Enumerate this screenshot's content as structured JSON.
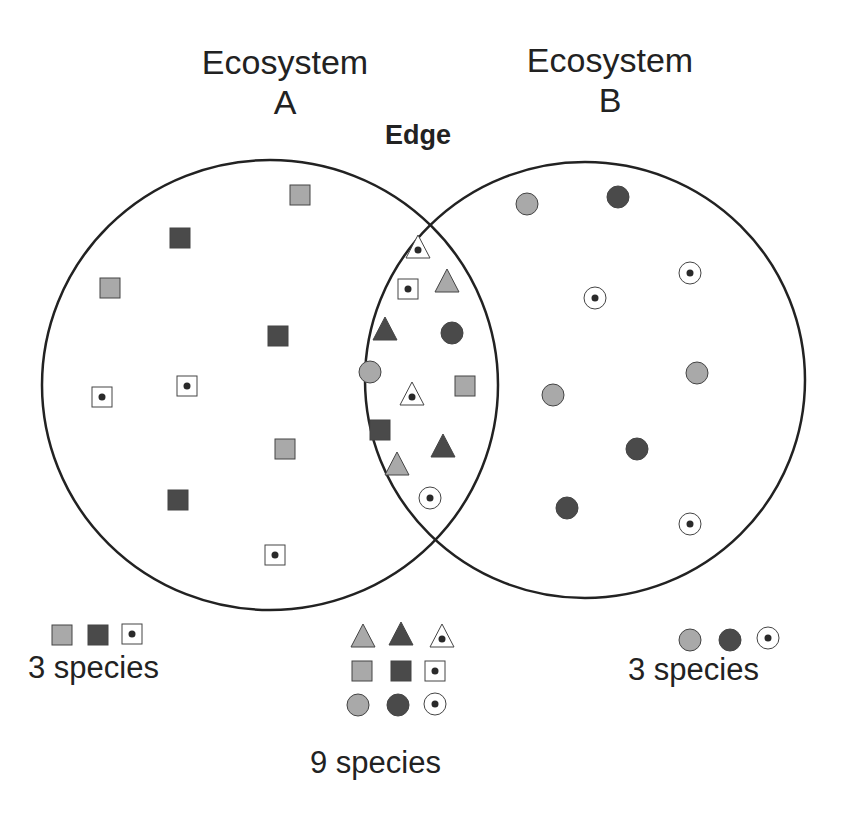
{
  "labels": {
    "ecosystem_a": [
      "Ecosystem",
      "A"
    ],
    "ecosystem_b": [
      "Ecosystem",
      "B"
    ],
    "edge": "Edge"
  },
  "counts": {
    "ecosystem_a": "3 species",
    "edge": "9 species",
    "ecosystem_b": "3 species"
  },
  "colors": {
    "stroke": "#222222",
    "light_fill": "#a9a9a9",
    "dark_fill": "#4a4a4a",
    "dot": "#2a2a2a"
  },
  "legend": {
    "ecosystem_a": [
      "square-light",
      "square-dark",
      "square-dot"
    ],
    "edge": [
      "triangle-light",
      "triangle-dark",
      "triangle-dot",
      "square-light",
      "square-dark",
      "square-dot",
      "circle-light",
      "circle-dark",
      "circle-dot"
    ],
    "ecosystem_b": [
      "circle-light",
      "circle-dark",
      "circle-dot"
    ]
  }
}
